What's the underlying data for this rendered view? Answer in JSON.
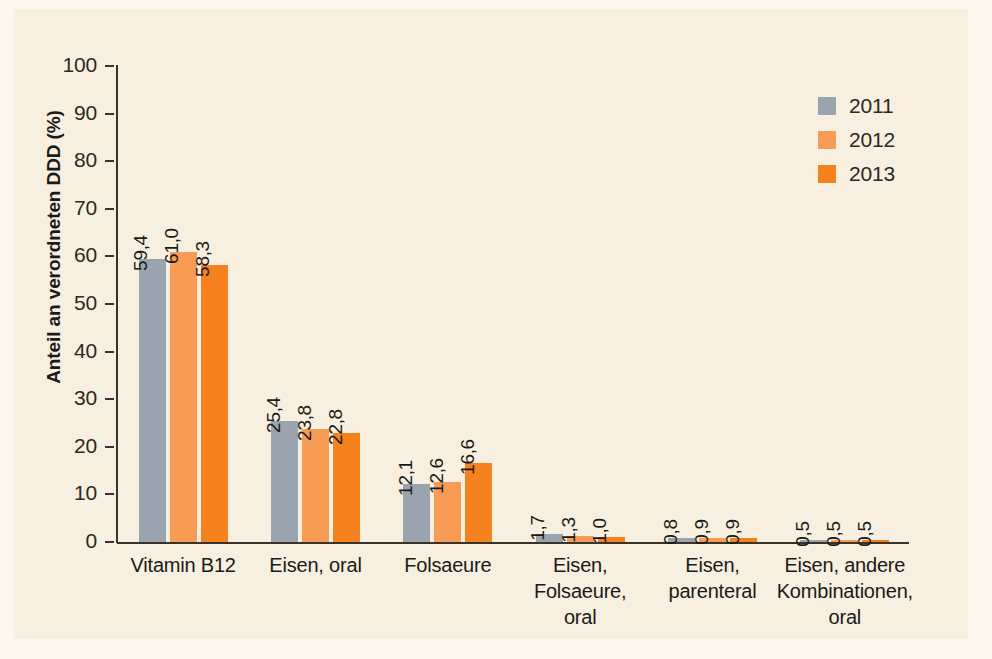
{
  "chart_data": {
    "type": "bar",
    "title": "",
    "subtitle": "",
    "xlabel": "",
    "ylabel": "Anteil an verordneten DDD (%)",
    "ylim": [
      0,
      100
    ],
    "yticks": [
      "0",
      "10",
      "20",
      "30",
      "40",
      "50",
      "60",
      "70",
      "80",
      "90",
      "100"
    ],
    "grid": false,
    "legend_position": "top-right",
    "categories": [
      "Vitamin B12",
      "Eisen, oral",
      "Folsaeure",
      "Eisen,\nFolsaeure,\noral",
      "Eisen,\nparenteral",
      "Eisen, andere\nKombinationen,\noral"
    ],
    "category_lines": [
      [
        "Vitamin B12"
      ],
      [
        "Eisen, oral"
      ],
      [
        "Folsaeure"
      ],
      [
        "Eisen,",
        "Folsaeure,",
        "oral"
      ],
      [
        "Eisen,",
        "parenteral"
      ],
      [
        "Eisen, andere",
        "Kombinationen,",
        "oral"
      ]
    ],
    "series": [
      {
        "name": "2011",
        "color": "#9aa4ae",
        "values": [
          59.4,
          25.4,
          12.1,
          1.7,
          0.8,
          0.5
        ],
        "labels": [
          "59,4",
          "25,4",
          "12,1",
          "1,7",
          "0,8",
          "0,5"
        ]
      },
      {
        "name": "2012",
        "color": "#f89c55",
        "values": [
          61.0,
          23.8,
          12.6,
          1.3,
          0.9,
          0.5
        ],
        "labels": [
          "61,0",
          "23,8",
          "12,6",
          "1,3",
          "0,9",
          "0,5"
        ]
      },
      {
        "name": "2013",
        "color": "#f5811f",
        "values": [
          58.3,
          22.8,
          16.6,
          1.0,
          0.9,
          0.5
        ],
        "labels": [
          "58,3",
          "22,8",
          "16,6",
          "1,0",
          "0,9",
          "0,5"
        ]
      }
    ]
  },
  "legend": {
    "items": [
      {
        "label": "2011",
        "color": "#9aa4ae"
      },
      {
        "label": "2012",
        "color": "#f89c55"
      },
      {
        "label": "2013",
        "color": "#f5811f"
      }
    ]
  },
  "colors": {
    "background": "#f7efe0",
    "outer_background": "#fdf8ee",
    "axis": "#3a332c",
    "text": "#1d1a16",
    "series_2011": "#9aa4ae",
    "series_2012": "#f89c55",
    "series_2013": "#f5811f"
  }
}
